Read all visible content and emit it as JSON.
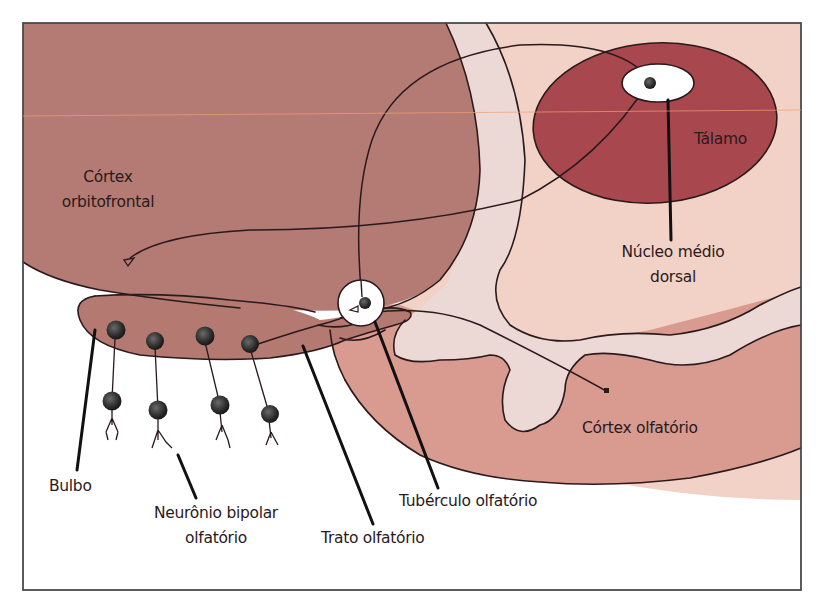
{
  "diagram": {
    "colors": {
      "background": "#ffffff",
      "frame": "#4a4a4a",
      "frontal_lobe": "#b47a74",
      "thalamus": "#a9474f",
      "diencephalon": "#f2d2c6",
      "white_matter": "#ecd9d6",
      "temporal_cortex": "#d99a90",
      "bulb": "#b47a72",
      "neuron": "#3a3a3a",
      "outline": "#2a1a1c",
      "nucleus_highlight": "#ffffff"
    },
    "labels": {
      "cortex_orbitofrontal_1": "Córtex",
      "cortex_orbitofrontal_2": "orbitofrontal",
      "talamo": "Tálamo",
      "nucleo_1": "Núcleo médio",
      "nucleo_2": "dorsal",
      "cortex_olfatorio": "Córtex olfatório",
      "tuberculo": "Tubérculo olfatório",
      "trato": "Trato olfatório",
      "neuronio_1": "Neurônio bipolar",
      "neuronio_2": "olfatório",
      "bulbo": "Bulbo"
    },
    "structures": [
      "Córtex orbitofrontal",
      "Tálamo",
      "Núcleo médio dorsal",
      "Córtex olfatório",
      "Tubérculo olfatório",
      "Trato olfatório",
      "Neurônio bipolar olfatório",
      "Bulbo"
    ]
  }
}
